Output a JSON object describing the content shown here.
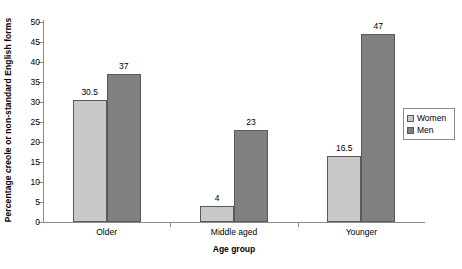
{
  "chart_data": {
    "type": "bar",
    "title": "",
    "subtitle": "",
    "xlabel": "Age group",
    "ylabel": "Percentage creole or non-standard English forms",
    "categories": [
      "Older",
      "Middle aged",
      "Younger"
    ],
    "series": [
      {
        "name": "Women",
        "values": [
          30.5,
          4,
          16.5
        ],
        "color": "#c8c8c8"
      },
      {
        "name": "Men",
        "values": [
          37,
          23,
          47
        ],
        "color": "#808080"
      }
    ],
    "value_labels": [
      [
        "30.5",
        "4",
        "16.5"
      ],
      [
        "37",
        "23",
        "47"
      ]
    ],
    "ylim": [
      0,
      50
    ],
    "ytick_step": 5,
    "ytick_labels": [
      "0",
      "5",
      "10",
      "15",
      "20",
      "25",
      "30",
      "35",
      "40",
      "45",
      "50"
    ],
    "grid": false,
    "legend_position": "right"
  },
  "legend": {
    "entries": [
      {
        "label": "Women",
        "color": "#c8c8c8"
      },
      {
        "label": "Men",
        "color": "#808080"
      }
    ]
  },
  "colors": {
    "women": "#c8c8c8",
    "men": "#808080",
    "bar_outline": "#5a5a5a",
    "axis": "#8a8a8a",
    "background": "#ffffff",
    "text": "#000000"
  }
}
